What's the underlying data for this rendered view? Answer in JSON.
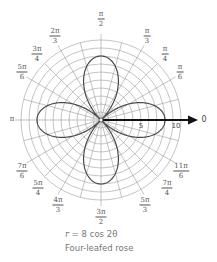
{
  "chart_data": {
    "type": "line",
    "coordinate_system": "polar",
    "title": "Four-leafed rose",
    "equation": "r = 8 cos 2θ",
    "equation_var": "r",
    "equation_rest": " = 8 cos 2θ",
    "rmax": 10,
    "r_ticks": [
      {
        "value": 5,
        "label": "5"
      },
      {
        "value": 10,
        "label": "10"
      }
    ],
    "polar_axis_label": "0",
    "grid": {
      "rings": [
        1,
        2,
        3,
        4,
        5,
        6,
        7,
        8,
        9,
        10
      ],
      "radial_step_deg": 15
    },
    "angle_labels": [
      {
        "angle": "π/2",
        "num": "π",
        "den": "2",
        "x": 101,
        "y": 19
      },
      {
        "angle": "π/3",
        "num": "π",
        "den": "3",
        "x": 147,
        "y": 36
      },
      {
        "angle": "π/4",
        "num": "π",
        "den": "4",
        "x": 165,
        "y": 54
      },
      {
        "angle": "π/6",
        "num": "π",
        "den": "6",
        "x": 180,
        "y": 72
      },
      {
        "angle": "2π/3",
        "num": "2π",
        "den": "3",
        "x": 55,
        "y": 36
      },
      {
        "angle": "3π/4",
        "num": "3π",
        "den": "4",
        "x": 37,
        "y": 54
      },
      {
        "angle": "5π/6",
        "num": "5π",
        "den": "6",
        "x": 22,
        "y": 72
      },
      {
        "angle": "π",
        "single": "π",
        "x": 12,
        "y": 119
      },
      {
        "angle": "7π/6",
        "num": "7π",
        "den": "6",
        "x": 22,
        "y": 171
      },
      {
        "angle": "5π/4",
        "num": "5π",
        "den": "4",
        "x": 38,
        "y": 188
      },
      {
        "angle": "4π/3",
        "num": "4π",
        "den": "3",
        "x": 58,
        "y": 205
      },
      {
        "angle": "3π/2",
        "num": "3π",
        "den": "2",
        "x": 101,
        "y": 217
      },
      {
        "angle": "5π/3",
        "num": "5π",
        "den": "3",
        "x": 145,
        "y": 205
      },
      {
        "angle": "7π/4",
        "num": "7π",
        "den": "4",
        "x": 167,
        "y": 188
      },
      {
        "angle": "11π/6",
        "num": "11π",
        "den": "6",
        "x": 181,
        "y": 171
      }
    ],
    "series": [
      {
        "name": "r = 8 cos 2θ",
        "amplitude": 8,
        "k": 2,
        "petals": 4,
        "petal_tips_deg": [
          0,
          90,
          180,
          270
        ],
        "color": "#555555"
      }
    ],
    "colors": {
      "grid": "#9a9a9a",
      "curve": "#4a4a4a",
      "axis": "#111111",
      "labels": "#555555"
    }
  },
  "caption": {
    "line1_var": "r",
    "line1_rest": " = 8 cos 2θ",
    "line2": "Four-leafed rose"
  }
}
